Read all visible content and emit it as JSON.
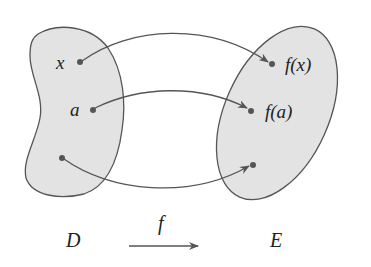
{
  "diagram": {
    "domain_set": {
      "label": "D"
    },
    "codomain_set": {
      "label": "E"
    },
    "function": {
      "label": "f"
    },
    "points": [
      {
        "domain_label": "x",
        "image_label": "f(x)"
      },
      {
        "domain_label": "a",
        "image_label": "f(a)"
      },
      {
        "domain_label": "",
        "image_label": ""
      }
    ],
    "colors": {
      "set_fill": "#e3e3e3",
      "stroke": "#555555",
      "text": "#222222"
    }
  }
}
